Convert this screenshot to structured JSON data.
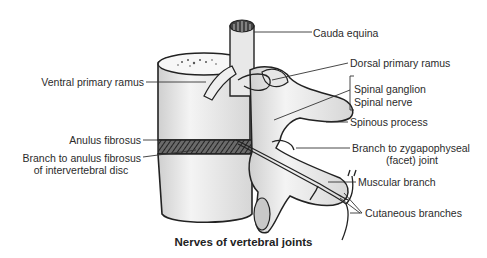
{
  "figure": {
    "caption": "Nerves of vertebral joints",
    "labels_left": [
      {
        "id": "ventral-primary-ramus",
        "text": "Ventral primary ramus"
      },
      {
        "id": "anulus-fibrosus",
        "text": "Anulus fibrosus"
      },
      {
        "id": "branch-to-anulus-line1",
        "text": "Branch to anulus fibrosus"
      },
      {
        "id": "branch-to-anulus-line2",
        "text": "of intervertebral disc"
      }
    ],
    "labels_right": [
      {
        "id": "cauda-equina",
        "text": "Cauda equina"
      },
      {
        "id": "dorsal-primary-ramus",
        "text": "Dorsal primary ramus"
      },
      {
        "id": "spinal-ganglion",
        "text": "Spinal ganglion"
      },
      {
        "id": "spinal-nerve",
        "text": "Spinal nerve"
      },
      {
        "id": "spinous-process",
        "text": "Spinous process"
      },
      {
        "id": "branch-to-zygapophyseal-line1",
        "text": "Branch to zygapophyseal"
      },
      {
        "id": "branch-to-zygapophyseal-line2",
        "text": "(facet) joint"
      },
      {
        "id": "muscular-branch",
        "text": "Muscular branch"
      },
      {
        "id": "cutaneous-branches",
        "text": "Cutaneous branches"
      }
    ],
    "colors": {
      "ink": "#2b2b2b",
      "bone_fill": "#ececec",
      "bone_shade": "#c9c9c9",
      "background": "#ffffff"
    }
  }
}
